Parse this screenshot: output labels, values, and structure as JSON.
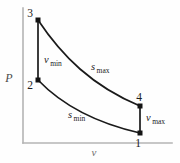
{
  "figure": {
    "kind": "pressure-volume-diagram",
    "cycle_name": "Stirling cycle"
  },
  "axes": {
    "y_label": "P",
    "x_label": "v",
    "origin": {
      "x": 23,
      "y": 143
    },
    "y_top": 8,
    "x_right": 172,
    "axis_color": "#b4b4b4"
  },
  "states": [
    {
      "id": "1",
      "label": "1",
      "x": 140,
      "y": 133,
      "label_x": 138,
      "label_y": 146,
      "anchor": "middle"
    },
    {
      "id": "2",
      "label": "2",
      "x": 38,
      "y": 80,
      "label_x": 30,
      "label_y": 88,
      "anchor": "middle"
    },
    {
      "id": "3",
      "label": "3",
      "x": 38,
      "y": 20,
      "label_x": 30,
      "label_y": 17,
      "anchor": "middle"
    },
    {
      "id": "4",
      "label": "4",
      "x": 140,
      "y": 106,
      "label_x": 139,
      "label_y": 101,
      "anchor": "middle"
    }
  ],
  "processes": [
    {
      "id": "isochoric-compression-2-3",
      "type": "line",
      "from": "2",
      "to": "3",
      "path": "M 38 80 L 38 20",
      "var": "v",
      "sub": "min",
      "label_x": 44,
      "label_y": 63
    },
    {
      "id": "isothermal-expansion-3-4",
      "type": "curve",
      "from": "3",
      "to": "4",
      "path": "M 38 20 C 62 56, 92 86, 140 106",
      "var": "s",
      "sub": "max",
      "label_x": 91,
      "label_y": 70
    },
    {
      "id": "isochoric-expansion-4-1",
      "type": "line",
      "from": "4",
      "to": "1",
      "path": "M 140 106 L 140 133",
      "var": "v",
      "sub": "max",
      "label_x": 146,
      "label_y": 120
    },
    {
      "id": "isothermal-compression-2-1",
      "type": "curve",
      "from": "2",
      "to": "1",
      "path": "M 38 80 C 62 105, 96 123, 140 133",
      "var": "s",
      "sub": "min",
      "label_x": 68,
      "label_y": 118
    }
  ],
  "colors": {
    "curve": "#1a1a1a",
    "axis": "#b4b4b4",
    "text": "#1c1c1c",
    "background": "#fefefe"
  }
}
